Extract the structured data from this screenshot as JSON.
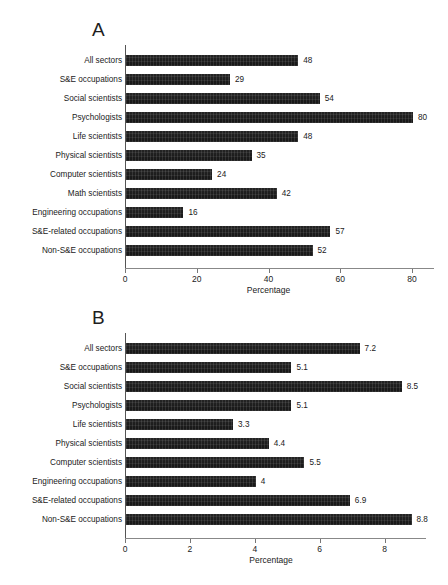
{
  "figure": {
    "panels": [
      {
        "letter": "A",
        "chart_data": {
          "type": "bar",
          "orientation": "horizontal",
          "title": "",
          "xlabel": "Percentage",
          "ylabel": "",
          "xlim": [
            0,
            80
          ],
          "xticks": [
            0,
            20,
            40,
            60,
            80
          ],
          "xticklabels": [
            "0",
            "20",
            "40",
            "60",
            "80"
          ],
          "grid": false,
          "legend": "none",
          "categories": [
            "All sectors",
            "S&E occupations",
            "Social scientists",
            "Psychologists",
            "Life scientists",
            "Physical scientists",
            "Computer scientists",
            "Math scientists",
            "Engineering occupations",
            "S&E-related occupations",
            "Non-S&E occupations"
          ],
          "values": [
            48,
            29,
            54,
            80,
            48,
            35,
            24,
            42,
            16,
            57,
            52
          ],
          "datalabels": [
            "48",
            "29",
            "54",
            "80",
            "48",
            "35",
            "24",
            "42",
            "16",
            "57",
            "52"
          ]
        }
      },
      {
        "letter": "B",
        "chart_data": {
          "type": "bar",
          "orientation": "horizontal",
          "title": "",
          "xlabel": "Percentage",
          "ylabel": "",
          "xlim": [
            0,
            9
          ],
          "xticks": [
            0,
            2,
            4,
            6,
            8
          ],
          "xticklabels": [
            "0",
            "2",
            "4",
            "6",
            "8"
          ],
          "grid": false,
          "legend": "none",
          "categories": [
            "All sectors",
            "S&E occupations",
            "Social scientists",
            "Psychologists",
            "Life scientists",
            "Physical scientists",
            "Computer scientists",
            "Engineering occupations",
            "S&E-related occupations",
            "Non-S&E occupations"
          ],
          "values": [
            7.2,
            5.1,
            8.5,
            5.1,
            3.3,
            4.4,
            5.5,
            4,
            6.9,
            8.8
          ],
          "datalabels": [
            "7.2",
            "5.1",
            "8.5",
            "5.1",
            "3.3",
            "4.4",
            "5.5",
            "4",
            "6.9",
            "8.8"
          ]
        }
      }
    ]
  },
  "colors": {
    "bar": "#181818",
    "axis": "#777777",
    "text": "#1a1a1a",
    "background": "#ffffff"
  }
}
